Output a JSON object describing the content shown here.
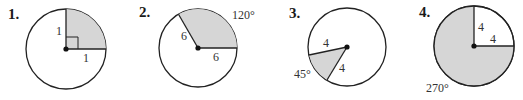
{
  "colors": {
    "shade": "#d6d6d6",
    "stroke": "#222222",
    "background": "#ffffff"
  },
  "figures": [
    {
      "number": "1.",
      "radius_label_a": "1",
      "radius_label_b": "1",
      "angle_label": "",
      "right_angle_marker": true,
      "shaded": "90° sector (upper right)"
    },
    {
      "number": "2.",
      "radius_label_a": "6",
      "radius_label_b": "6",
      "angle_label": "120°",
      "shaded": "120° sector"
    },
    {
      "number": "3.",
      "radius_label_a": "4",
      "radius_label_b": "4",
      "angle_label": "45°",
      "shaded": "45° sector (lower left)"
    },
    {
      "number": "4.",
      "radius_label_a": "4",
      "radius_label_b": "4",
      "angle_label": "270°",
      "shaded": "270° sector (major)"
    }
  ]
}
